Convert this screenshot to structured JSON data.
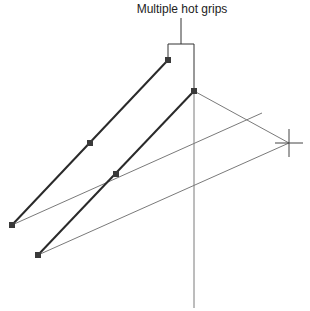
{
  "callout": {
    "label": "Multiple hot grips"
  },
  "colors": {
    "heavy_line": "#2a2a2a",
    "thin_line": "#7a7a7a",
    "grip": "#3a3a3a",
    "text": "#222222"
  },
  "lines": {
    "selected": [
      {
        "x1": 12,
        "y1": 225,
        "x2": 168,
        "y2": 60
      },
      {
        "x1": 38,
        "y1": 255,
        "x2": 194,
        "y2": 91
      }
    ],
    "rubberband": [
      {
        "x1": 12,
        "y1": 225,
        "x2": 262,
        "y2": 113
      },
      {
        "x1": 38,
        "y1": 255,
        "x2": 289,
        "y2": 143
      },
      {
        "x1": 194,
        "y1": 91,
        "x2": 289,
        "y2": 143
      }
    ],
    "vertical": {
      "x": 194,
      "y1": 91,
      "y2": 308
    }
  },
  "grips": [
    {
      "x": 168,
      "y": 60,
      "hot": true
    },
    {
      "x": 90,
      "y": 143,
      "hot": false
    },
    {
      "x": 12,
      "y": 225,
      "hot": false
    },
    {
      "x": 194,
      "y": 91,
      "hot": true
    },
    {
      "x": 116,
      "y": 174,
      "hot": false
    },
    {
      "x": 38,
      "y": 255,
      "hot": false
    }
  ],
  "crosshair": {
    "x": 289,
    "y": 143
  }
}
